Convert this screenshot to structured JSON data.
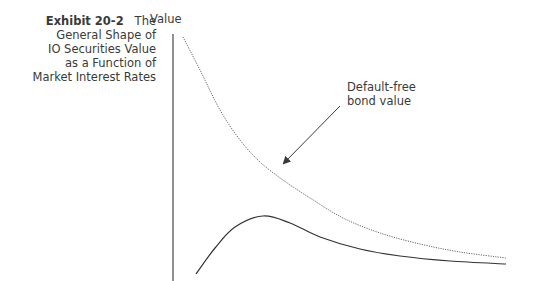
{
  "figure": {
    "exhibit_label": "Exhibit 20-2",
    "title_first": "The",
    "title_lines": [
      "General Shape of",
      "IO Securities Value",
      "as a Function of",
      "Market Interest Rates"
    ]
  },
  "chart_data": {
    "type": "line",
    "xlabel": "",
    "ylabel": "Value",
    "grid": false,
    "legend": "none",
    "annotations": [
      {
        "text": "Default-free bond value",
        "arrow_to_series": "Default-free bond value"
      }
    ],
    "series": [
      {
        "name": "Default-free bond value",
        "style": "dotted",
        "points_px": [
          [
            183,
            37
          ],
          [
            200,
            70
          ],
          [
            220,
            110
          ],
          [
            240,
            140
          ],
          [
            260,
            162
          ],
          [
            283,
            180
          ],
          [
            310,
            198
          ],
          [
            343,
            218
          ],
          [
            380,
            233
          ],
          [
            420,
            244
          ],
          [
            460,
            252
          ],
          [
            506,
            258
          ]
        ]
      },
      {
        "name": "IO securities value",
        "style": "solid",
        "points_px": [
          [
            196,
            274
          ],
          [
            215,
            248
          ],
          [
            235,
            227
          ],
          [
            263,
            216
          ],
          [
            290,
            223
          ],
          [
            320,
            237
          ],
          [
            360,
            249
          ],
          [
            400,
            256
          ],
          [
            450,
            261
          ],
          [
            506,
            264
          ]
        ]
      }
    ]
  },
  "labels": {
    "y_axis": "Value",
    "annotation_line1": "Default-free",
    "annotation_line2": "bond value"
  }
}
